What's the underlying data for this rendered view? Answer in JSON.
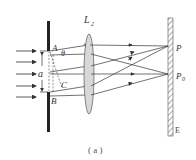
{
  "figure": {
    "caption": "( a )",
    "labels": {
      "lens": "L",
      "lens_sub": "2",
      "point_a": "A",
      "point_b": "B",
      "point_c": "C",
      "slit_width": "a",
      "angle": "θ",
      "screen_point": "P",
      "screen_center": "P",
      "screen_center_sub": "0",
      "screen": "E"
    },
    "colors": {
      "stroke": "#333333",
      "lens_fill": "#d8d8d8",
      "slit": "#222222"
    },
    "components": [
      "incident parallel light",
      "single slit AB of width a",
      "converging lens L2",
      "screen E"
    ]
  }
}
